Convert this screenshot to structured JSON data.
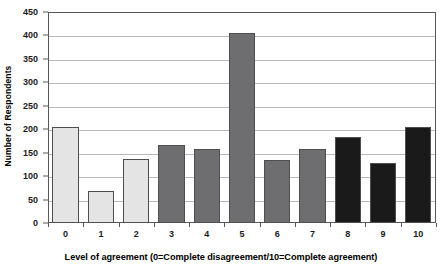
{
  "chart_data": {
    "type": "bar",
    "title": "",
    "xlabel": "Level of agreement (0=Complete disagreement/10=Complete agreement)",
    "ylabel": "Number of Respondents",
    "categories": [
      "0",
      "1",
      "2",
      "3",
      "4",
      "5",
      "6",
      "7",
      "8",
      "9",
      "10"
    ],
    "values": [
      205,
      69,
      137,
      167,
      158,
      405,
      134,
      157,
      184,
      127,
      205
    ],
    "bar_colors": [
      "#e4e4e4",
      "#e4e4e4",
      "#e4e4e4",
      "#6e6e70",
      "#6e6e70",
      "#6e6e70",
      "#6e6e70",
      "#6e6e70",
      "#1a1a1a",
      "#1a1a1a",
      "#1a1a1a"
    ],
    "bar_border_color": "#4f4f51",
    "ylim": [
      0,
      450
    ],
    "ytick_values": [
      0,
      50,
      100,
      150,
      200,
      250,
      300,
      350,
      400,
      450
    ],
    "ytick_labels": [
      "0",
      "50",
      "100",
      "150",
      "200",
      "250",
      "300",
      "350",
      "400",
      "450"
    ],
    "grid": true,
    "grid_color": "#b9b9bb",
    "legend": "none",
    "axis_color": "#58585a",
    "background": "#ffffff"
  }
}
